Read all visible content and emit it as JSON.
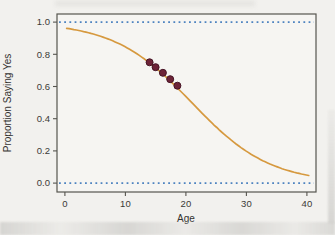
{
  "figure": {
    "background_color": "#f2f1ee",
    "plot_background": "#f6f5f2",
    "frame_color": "#56554f",
    "tick_color": "#56554f"
  },
  "chart_data": {
    "type": "line",
    "title": "",
    "xlabel": "Age",
    "ylabel": "Proportion Saying Yes",
    "xlim": [
      -1.3,
      41.5
    ],
    "ylim": [
      -0.055,
      1.05
    ],
    "grid": false,
    "legend": "none",
    "x_ticks": [
      0,
      10,
      20,
      30,
      40
    ],
    "x_tick_labels": [
      "0",
      "10",
      "20",
      "30",
      "40"
    ],
    "y_ticks": [
      0.0,
      0.2,
      0.4,
      0.6,
      0.8,
      1.0
    ],
    "y_tick_labels": [
      "0.0",
      "0.2",
      "0.4",
      "0.6",
      "0.8",
      "1.0"
    ],
    "reference_lines": {
      "description": "horizontal dotted asymptote lines at proportion 0 and 1",
      "values": [
        0.0,
        1.0
      ],
      "style": "dotted",
      "color": "#4d83c0"
    },
    "curve": {
      "name": "fitted-logistic-curve",
      "type": "logistic",
      "formula": "p = 1/(1+exp(-(3.25 - 0.155*age)))",
      "intercept": 3.25,
      "slope": -0.155,
      "x_start": 0.3,
      "x_end": 40.4,
      "color": "#d6993f",
      "sample_points": {
        "x": [
          0,
          5,
          10,
          15,
          20,
          25,
          30,
          35,
          40
        ],
        "y": [
          0.963,
          0.922,
          0.847,
          0.722,
          0.549,
          0.362,
          0.211,
          0.112,
          0.056
        ]
      }
    },
    "points": {
      "name": "observed-data-points",
      "x": [
        14,
        15,
        16.2,
        17.4,
        18.6
      ],
      "y": [
        0.75,
        0.72,
        0.685,
        0.645,
        0.605
      ],
      "color": "#6d2438",
      "stroke": "#471526"
    }
  }
}
